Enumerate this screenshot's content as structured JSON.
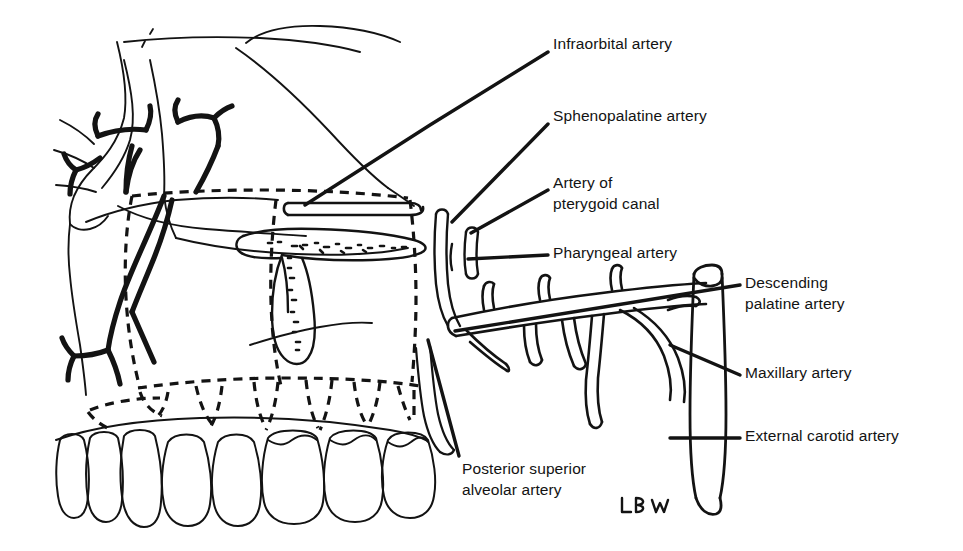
{
  "figure": {
    "type": "anatomical-line-diagram",
    "background_color": "#ffffff",
    "ink_color": "#131313",
    "signature": "LBW"
  },
  "labels": [
    {
      "id": "infraorbital-artery",
      "lines": [
        "Infraorbital artery"
      ],
      "text_x": 553,
      "text_y": 33,
      "leader": [
        [
          548,
          52
        ],
        [
          430,
          125
        ],
        [
          305,
          205
        ]
      ]
    },
    {
      "id": "sphenopalatine-artery",
      "lines": [
        "Sphenopalatine artery"
      ],
      "text_x": 553,
      "text_y": 105,
      "leader": [
        [
          548,
          124
        ],
        [
          452,
          222
        ]
      ]
    },
    {
      "id": "artery-of-pterygoid-canal",
      "lines": [
        "Artery of",
        "pterygoid canal"
      ],
      "text_x": 553,
      "text_y": 172,
      "leader": [
        [
          548,
          190
        ],
        [
          471,
          233
        ]
      ]
    },
    {
      "id": "pharyngeal-artery",
      "lines": [
        "Pharyngeal artery"
      ],
      "text_x": 553,
      "text_y": 242,
      "leader": [
        [
          548,
          255
        ],
        [
          468,
          259
        ]
      ]
    },
    {
      "id": "descending-palatine-artery",
      "lines": [
        "Descending",
        "palatine artery"
      ],
      "text_x": 745,
      "text_y": 272,
      "leader": [
        [
          740,
          285
        ],
        [
          455,
          331
        ]
      ]
    },
    {
      "id": "maxillary-artery",
      "lines": [
        "Maxillary artery"
      ],
      "text_x": 745,
      "text_y": 362,
      "leader": [
        [
          740,
          375
        ],
        [
          670,
          345
        ]
      ]
    },
    {
      "id": "external-carotid-artery",
      "lines": [
        "External carotid artery"
      ],
      "text_x": 745,
      "text_y": 425,
      "leader": [
        [
          740,
          438
        ],
        [
          670,
          438
        ]
      ]
    },
    {
      "id": "posterior-superior-alveolar-artery",
      "lines": [
        "Posterior superior",
        "alveolar artery"
      ],
      "text_x": 462,
      "text_y": 458,
      "leader": [
        [
          459,
          456
        ],
        [
          428,
          340
        ]
      ]
    }
  ]
}
